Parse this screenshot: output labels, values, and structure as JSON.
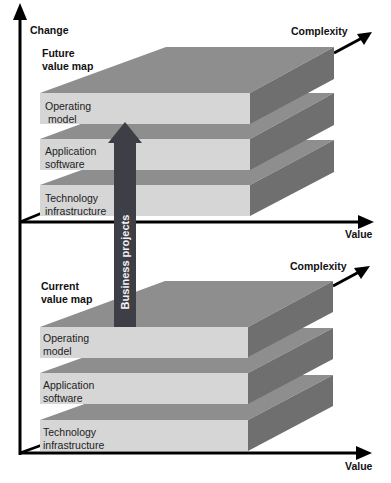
{
  "axes": {
    "vertical_label": "Change",
    "upper": {
      "x_label": "Value",
      "depth_label": "Complexity"
    },
    "lower": {
      "x_label": "Value",
      "depth_label": "Complexity"
    }
  },
  "upper_map": {
    "title_line1": "Future",
    "title_line2": "value map",
    "layers": [
      {
        "line1": "Operating",
        "line2": "model"
      },
      {
        "line1": "Application",
        "line2": "software"
      },
      {
        "line1": "Technology",
        "line2": "infrastructure"
      }
    ]
  },
  "lower_map": {
    "title_line1": "Current",
    "title_line2": "value map",
    "layers": [
      {
        "line1": "Operating",
        "line2": "model"
      },
      {
        "line1": "Application",
        "line2": "software"
      },
      {
        "line1": "Technology",
        "line2": "infrastructure"
      }
    ]
  },
  "arrow": {
    "label": "Business projects"
  },
  "colors": {
    "front_face": "#d6d6d6",
    "top_face": "#8e8e8e",
    "side_face": "#6f6f6f",
    "arrow_fill": "#3e3e46",
    "axis": "#000000"
  }
}
